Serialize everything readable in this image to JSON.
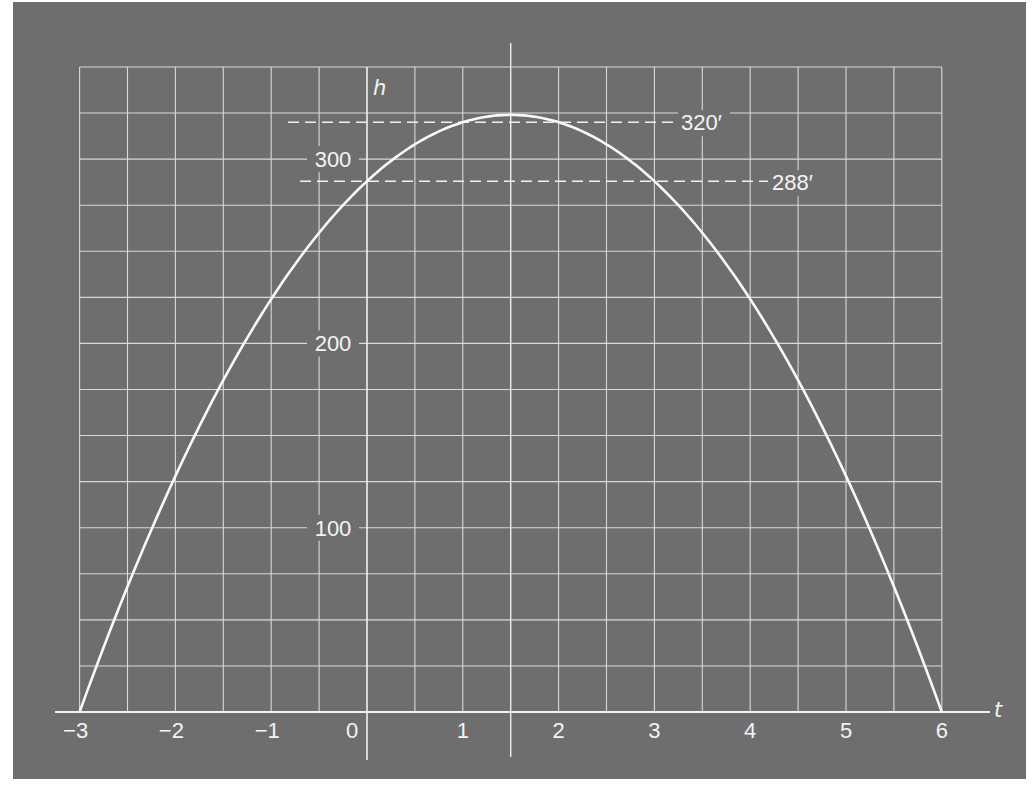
{
  "chart_data": {
    "type": "line",
    "title": "",
    "xlabel": "t",
    "ylabel": "h",
    "function": "h = -16t^2 + 48t + 288",
    "xlim": [
      -3,
      6
    ],
    "ylim": [
      0,
      350
    ],
    "x_ticks": [
      -3,
      -2,
      -1,
      0,
      1,
      2,
      3,
      4,
      5,
      6
    ],
    "x_tick_labels": [
      "−3",
      "−2",
      "−1",
      "0",
      "1",
      "2",
      "3",
      "4",
      "5",
      "6"
    ],
    "y_ticks": [
      100,
      200,
      300
    ],
    "y_tick_labels": [
      "100",
      "200",
      "300"
    ],
    "grid": true,
    "grid_x_step": 0.5,
    "grid_y_step": 25,
    "series": [
      {
        "name": "h(t)",
        "x": [
          -3,
          -2.5,
          -2,
          -1.5,
          -1,
          -0.5,
          0,
          0.5,
          1,
          1.5,
          2,
          2.5,
          3,
          3.5,
          4,
          4.5,
          5,
          5.5,
          6
        ],
        "values": [
          0,
          68,
          128,
          180,
          224,
          260,
          288,
          308,
          320,
          324,
          320,
          308,
          288,
          260,
          224,
          180,
          128,
          68,
          0
        ]
      }
    ],
    "reference_lines": [
      {
        "type": "horizontal",
        "y": 320,
        "label": "320′",
        "style": "dashed"
      },
      {
        "type": "horizontal",
        "y": 288,
        "label": "288′",
        "style": "dashed"
      },
      {
        "type": "vertical",
        "x": 1.5,
        "label": "",
        "style": "solid"
      }
    ],
    "legend": null
  },
  "axes": {
    "x_label": "t",
    "y_label": "h"
  },
  "annotations": {
    "peak_label": "320′",
    "start_label": "288′"
  },
  "colors": {
    "background": "#6e6e6e",
    "grid": "#d9d9d9",
    "curve": "#f8f8f8",
    "text": "#f4f4f4"
  }
}
